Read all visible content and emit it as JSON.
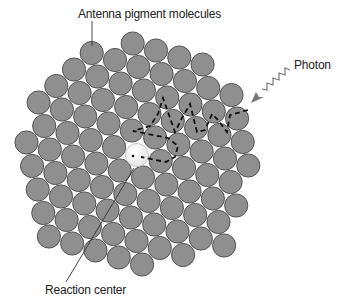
{
  "diagram": {
    "labels": {
      "antenna": {
        "text": "Antenna pigment molecules",
        "x": 78,
        "y": 7
      },
      "photon": {
        "text": "Photon",
        "x": 294,
        "y": 58
      },
      "reaction_center": {
        "text": "Reaction center",
        "x": 45,
        "y": 283
      }
    },
    "colors": {
      "pigment_fill": "#8f8f8f",
      "pigment_stroke": "#4a4a4a",
      "reaction_center_fill": "#e6e6e6",
      "path": "#111111",
      "line": "#333333",
      "photon": "#777777"
    },
    "pigment_radius": 11.6,
    "lattice": {
      "origin": [
        115,
        60
      ],
      "a": [
        23.3,
        7
      ],
      "b": [
        5.6,
        23.5
      ],
      "rows": [
        {
          "j": -1,
          "from": 1,
          "to": 4
        },
        {
          "j": 0,
          "from": -1,
          "to": 5
        },
        {
          "j": 1,
          "from": -2,
          "to": 5
        },
        {
          "j": 2,
          "from": -3,
          "to": 5
        },
        {
          "j": 3,
          "from": -4,
          "to": 5
        },
        {
          "j": 4,
          "from": -4,
          "to": 4
        },
        {
          "j": 5,
          "from": -5,
          "to": 4
        },
        {
          "j": 6,
          "from": -5,
          "to": 3
        },
        {
          "j": 7,
          "from": -5,
          "to": 3
        },
        {
          "j": 8,
          "from": -5,
          "to": 1
        },
        {
          "j": 9,
          "from": -5,
          "to": -1
        }
      ]
    },
    "reaction_center": {
      "cx": 137,
      "cy": 155,
      "r": 11.6
    },
    "energy_path": [
      [
        248,
        110
      ],
      [
        230,
        115
      ],
      [
        227,
        132
      ],
      [
        218,
        120
      ],
      [
        212,
        114
      ],
      [
        205,
        130
      ],
      [
        197,
        132
      ],
      [
        190,
        104
      ],
      [
        182,
        118
      ],
      [
        175,
        132
      ],
      [
        163,
        98
      ],
      [
        158,
        114
      ],
      [
        150,
        126
      ],
      [
        133,
        131
      ],
      [
        168,
        138
      ],
      [
        178,
        146
      ],
      [
        175,
        157
      ],
      [
        166,
        162
      ],
      [
        141,
        157
      ]
    ],
    "antenna_pointer": [
      [
        92,
        21
      ],
      [
        92,
        46
      ]
    ],
    "reaction_pointer": [
      [
        134,
        168
      ],
      [
        66,
        282
      ]
    ],
    "photon_wave": [
      [
        290,
        70
      ],
      [
        285,
        68
      ],
      [
        285,
        75
      ],
      [
        279,
        73
      ],
      [
        279,
        80
      ],
      [
        273,
        78
      ],
      [
        273,
        85
      ],
      [
        267,
        83
      ],
      [
        267,
        90
      ],
      [
        262,
        89
      ]
    ],
    "photon_arrow_tip": [
      251,
      103
    ]
  }
}
